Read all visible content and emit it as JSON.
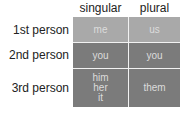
{
  "table": {
    "columns": [
      "singular",
      "plural"
    ],
    "rows": [
      {
        "label": "1st person",
        "singular": [
          "me"
        ],
        "plural": [
          "us"
        ]
      },
      {
        "label": "2nd person",
        "singular": [
          "you"
        ],
        "plural": [
          "you"
        ]
      },
      {
        "label": "3rd person",
        "singular": [
          "him",
          "her",
          "it"
        ],
        "plural": [
          "them"
        ]
      }
    ]
  },
  "colors": {
    "row1_fill": "#a9a9a9",
    "row23_fill": "#7b7b7b",
    "divider": "#f2f2f2",
    "label_text": "#222222",
    "cell_text": "#dcdcdc"
  }
}
